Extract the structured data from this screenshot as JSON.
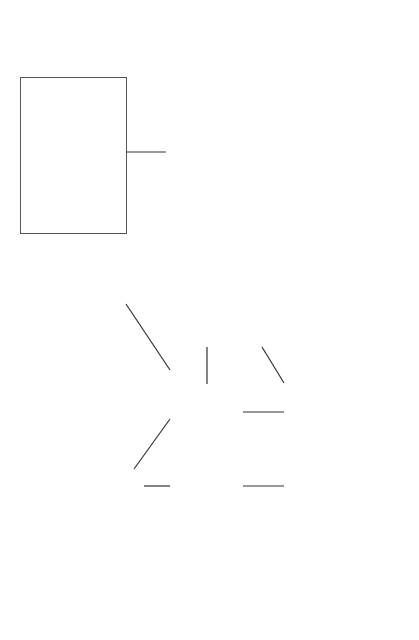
{
  "context": {
    "title": "Context",
    "items": [
      "Design Elements",
      "Resources",
      "Site",
      "Specifications",
      "Suppliers",
      "Materials",
      "Element Activities",
      "Project Activities",
      "Groups",
      "Decisions"
    ]
  },
  "operators": {
    "title": "Operators",
    "design_element": {
      "title": "Design Element Operators",
      "items": [
        "Group",
        "Create EA"
      ]
    },
    "element_activity": {
      "title": "Element Activity Operators",
      "items": [
        "Group",
        "Amount",
        "Unit",
        "Material",
        "Create PA"
      ]
    },
    "project_activity": {
      "title": "Project Activity Operators",
      "items": [
        "Group",
        "Precedences",
        "Lags",
        "Technology",
        "Duration",
        "Scheduling",
        "Cost"
      ]
    }
  },
  "menu_interface": {
    "label": "Menu Driven Interface"
  },
  "ks_module": {
    "label": "Knowledge Source Acquisition Module"
  },
  "user": {
    "label": "User"
  },
  "knowledge_base": {
    "title": "Knowledge Base",
    "items": [
      "KS Create EA",
      "KS Amount",
      "KS Unit",
      "KS Material",
      "KS Create PA",
      "KS Precedences",
      "KS Lags",
      "KS Technology",
      "KS Duration"
    ]
  },
  "caption": {
    "text": "Figure 15.11 ..."
  },
  "colors": {
    "line": "#555555",
    "text": "#444444",
    "background": "#ffffff"
  }
}
